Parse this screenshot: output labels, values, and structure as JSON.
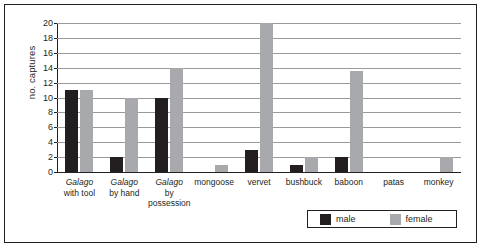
{
  "chart_data": {
    "type": "bar",
    "title": "",
    "xlabel": "",
    "ylabel": "no. captures",
    "ylim": [
      0,
      20
    ],
    "yticks": [
      0,
      2,
      4,
      6,
      8,
      10,
      12,
      14,
      16,
      18,
      20
    ],
    "grid": true,
    "legend_position": "bottom-right",
    "categories": [
      "Galago with tool",
      "Galago by hand",
      "Galago by possession",
      "mongoose",
      "vervet",
      "bushbuck",
      "baboon",
      "patas",
      "monkey"
    ],
    "category_lines": [
      [
        "Galago",
        "with tool"
      ],
      [
        "Galago",
        "by hand"
      ],
      [
        "Galago",
        "by",
        "possession"
      ],
      [
        "mongoose"
      ],
      [
        "vervet"
      ],
      [
        "bushbuck"
      ],
      [
        "baboon"
      ],
      [
        "patas"
      ],
      [
        "monkey"
      ]
    ],
    "category_italic_first_line": [
      true,
      true,
      true,
      false,
      false,
      false,
      false,
      false,
      false
    ],
    "series": [
      {
        "name": "male",
        "color": "#231f20",
        "values": [
          11,
          2,
          10,
          0,
          3,
          1,
          2,
          0,
          0
        ]
      },
      {
        "name": "female",
        "color": "#a7a9ac",
        "values": [
          11,
          10,
          14,
          1,
          20,
          2,
          13.5,
          0,
          2
        ]
      }
    ]
  },
  "legend": {
    "items": [
      {
        "label": "male",
        "color": "#231f20"
      },
      {
        "label": "female",
        "color": "#a7a9ac"
      }
    ]
  },
  "axis": {
    "y_title": "no. captures"
  }
}
